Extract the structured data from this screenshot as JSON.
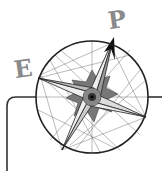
{
  "logo": {
    "letters": {
      "left": "E",
      "top": "P"
    },
    "icon": "compass-rose-icon",
    "colors": {
      "line": "#222222",
      "letters": "#8a8a8a",
      "background": "#ffffff"
    }
  }
}
